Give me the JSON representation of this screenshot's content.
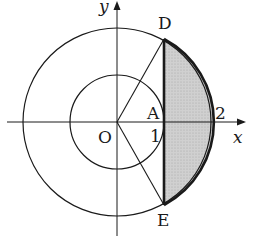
{
  "figure": {
    "axes": {
      "x_label": "x",
      "y_label": "y"
    },
    "points": {
      "origin": "O",
      "A": "A",
      "D": "D",
      "E": "E"
    },
    "tick_labels": {
      "one": "1",
      "two": "2"
    },
    "circles": [
      {
        "name": "inner-circle",
        "center": "O",
        "radius": 1
      },
      {
        "name": "outer-circle",
        "center": "O",
        "radius": 2
      }
    ],
    "chord": {
      "from": "D",
      "to": "E",
      "x": 1
    },
    "shaded_region": "segment of outer circle with x >= 1 (between chord DE and arc DE)",
    "colors": {
      "stroke": "#1a1a1a",
      "shade": "#c8c8c8",
      "background": "#ffffff"
    }
  }
}
